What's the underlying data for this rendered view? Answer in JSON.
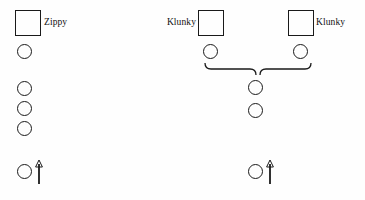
{
  "diagram": {
    "background_color": "#fefefe",
    "stroke_color": "#1a1a1a",
    "width": 365,
    "height": 200,
    "labels": [
      {
        "text": "Zippy",
        "x": 44,
        "y": 18,
        "align": "left",
        "for": "square-zippy"
      },
      {
        "text": "Klunky",
        "x": 196,
        "y": 18,
        "align": "right",
        "for": "square-klunky-left"
      },
      {
        "text": "Klunky",
        "x": 316,
        "y": 18,
        "align": "left",
        "for": "square-klunky-right"
      }
    ],
    "squares": [
      {
        "id": "square-zippy",
        "x": 15,
        "y": 10,
        "size": 26
      },
      {
        "id": "square-klunky-left",
        "x": 198,
        "y": 10,
        "size": 26
      },
      {
        "id": "square-klunky-right",
        "x": 288,
        "y": 10,
        "size": 26
      }
    ],
    "circles": [
      {
        "id": "circle-left-1",
        "x": 17,
        "y": 44,
        "size": 15
      },
      {
        "id": "circle-left-2",
        "x": 17,
        "y": 81,
        "size": 15
      },
      {
        "id": "circle-left-3",
        "x": 17,
        "y": 101,
        "size": 15
      },
      {
        "id": "circle-left-4",
        "x": 17,
        "y": 121,
        "size": 15
      },
      {
        "id": "circle-left-5",
        "x": 17,
        "y": 164,
        "size": 15
      },
      {
        "id": "circle-parent-left",
        "x": 203,
        "y": 44,
        "size": 15
      },
      {
        "id": "circle-parent-right",
        "x": 293,
        "y": 44,
        "size": 15
      },
      {
        "id": "circle-child-1",
        "x": 248,
        "y": 80,
        "size": 15
      },
      {
        "id": "circle-child-2",
        "x": 248,
        "y": 103,
        "size": 15
      },
      {
        "id": "circle-child-3",
        "x": 248,
        "y": 164,
        "size": 15
      }
    ],
    "arrows": [
      {
        "id": "arrow-proband-left",
        "x": 39,
        "y_top": 160,
        "y_bottom": 184
      },
      {
        "id": "arrow-proband-right",
        "x": 270,
        "y_top": 160,
        "y_bottom": 184
      }
    ],
    "braces": [
      {
        "id": "brace-left",
        "d": "M 205 63 Q 205 69 211 69 L 250 69 Q 256 69 256 75"
      },
      {
        "id": "brace-right",
        "d": "M 311 63 Q 311 69 305 69 L 266 69 Q 260 69 260 75"
      }
    ]
  }
}
